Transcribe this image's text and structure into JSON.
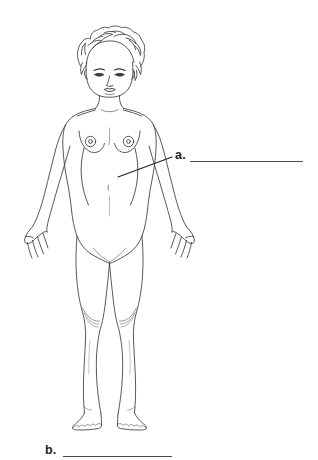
{
  "worksheet": {
    "title": "Female Body Anatomy Labeling Diagram",
    "background_color": "#ffffff",
    "line_color": "#3a3a3a",
    "text_color": "#231f20",
    "blank_color": "#4d4d4f"
  },
  "figure": {
    "name": "female-body-front-view-line-drawing",
    "parts": [
      "curly-hair",
      "face",
      "eyes",
      "nose",
      "mouth",
      "neck",
      "shoulders",
      "breasts",
      "nipples",
      "navel",
      "arms",
      "hands",
      "fingers",
      "hips",
      "legs",
      "knees",
      "feet",
      "toes"
    ]
  },
  "labels": [
    {
      "id": "a",
      "marker": "a.",
      "blank_value": "",
      "pointer_from_x": 118,
      "pointer_from_y": 177,
      "pointer_to_x": 172,
      "pointer_to_y": 157,
      "blank_x": 190,
      "blank_y": 161,
      "blank_width": 113
    },
    {
      "id": "b",
      "marker": "b.",
      "blank_value": "",
      "blank_x": 63,
      "blank_y": 456,
      "blank_width": 109
    }
  ]
}
